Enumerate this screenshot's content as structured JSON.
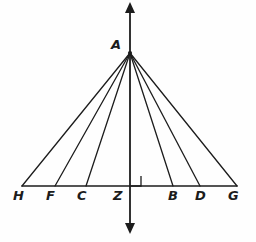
{
  "figure": {
    "name": "angle-bisector-ray-fan-diagram",
    "background_color": "#fefefe",
    "stroke_color": "#1c1c1c",
    "label_color": "#1c1c1c",
    "width": 256,
    "height": 242
  },
  "apex": {
    "label": "A",
    "x": 130,
    "y": 53,
    "label_x": 111,
    "label_y": 38
  },
  "axis": {
    "name": "vertical-axis",
    "x": 130,
    "top_y": 2,
    "bottom_y": 234,
    "has_top_arrow": true,
    "has_bottom_arrow": true
  },
  "baseline": {
    "name": "horizontal-baseline",
    "y": 186,
    "x_start": 22,
    "x_end": 237
  },
  "right_angle": {
    "name": "right-angle-marker",
    "x": 131,
    "y": 176,
    "size": 10,
    "side": "right-of-axis"
  },
  "points": [
    {
      "label": "H",
      "x": 22,
      "label_x": 13,
      "side": "left"
    },
    {
      "label": "F",
      "x": 55,
      "label_x": 46,
      "side": "left"
    },
    {
      "label": "C",
      "x": 86,
      "label_x": 77,
      "side": "left"
    },
    {
      "label": "Z",
      "x": 130,
      "label_x": 113,
      "side": "center"
    },
    {
      "label": "B",
      "x": 173,
      "label_x": 168,
      "side": "right"
    },
    {
      "label": "D",
      "x": 200,
      "label_x": 195,
      "side": "right"
    },
    {
      "label": "G",
      "x": 237,
      "label_x": 228,
      "side": "right"
    }
  ],
  "rays": [
    {
      "name": "ray-A-H",
      "from": "A",
      "to": "H"
    },
    {
      "name": "ray-A-F",
      "from": "A",
      "to": "F"
    },
    {
      "name": "ray-A-C",
      "from": "A",
      "to": "C"
    },
    {
      "name": "ray-A-B",
      "from": "A",
      "to": "B"
    },
    {
      "name": "ray-A-D",
      "from": "A",
      "to": "D"
    },
    {
      "name": "ray-A-G",
      "from": "A",
      "to": "G"
    }
  ]
}
